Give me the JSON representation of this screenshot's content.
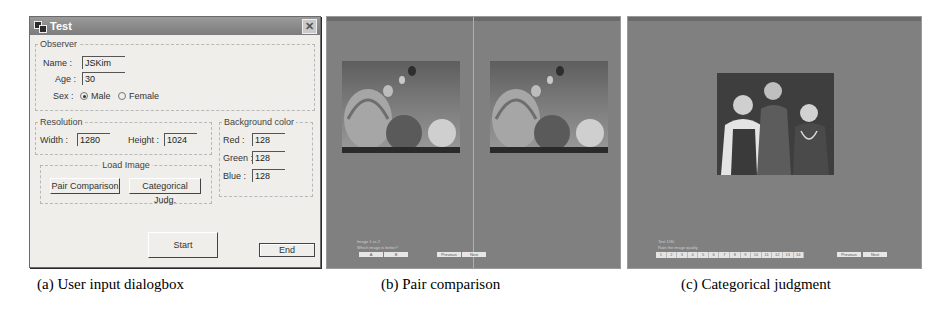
{
  "dialog": {
    "title": "Test",
    "observer": {
      "legend": "Observer",
      "name_label": "Name :",
      "name_value": "JSKim",
      "age_label": "Age :",
      "age_value": "30",
      "sex_label": "Sex :",
      "sex_options": [
        "Male",
        "Female"
      ],
      "sex_selected": "Male"
    },
    "resolution": {
      "legend": "Resolution",
      "width_label": "Width :",
      "width_value": "1280",
      "height_label": "Height :",
      "height_value": "1024"
    },
    "background_color": {
      "legend": "Background color",
      "red_label": "Red :",
      "red_value": "128",
      "green_label": "Green :",
      "green_value": "128",
      "blue_label": "Blue :",
      "blue_value": "128"
    },
    "load_image": {
      "legend": "Load Image",
      "pair_button": "Pair Comparison",
      "categorical_button": "Categorical Judg."
    },
    "start_button": "Start",
    "end_button": "End"
  },
  "pair_screen": {
    "image_subject": "hot air balloons",
    "prompt_line1": "Image 1 vs 2",
    "prompt_line2": "Which image is better?",
    "choice_buttons": [
      "A",
      "B"
    ],
    "nav_buttons": [
      "Previous",
      "Next"
    ]
  },
  "categorical_screen": {
    "image_subject": "three people in costumes",
    "prompt_line1": "Test 1/30",
    "prompt_line2": "Rate the image quality",
    "scale": [
      "1",
      "2",
      "3",
      "4",
      "5",
      "6",
      "7",
      "8",
      "9",
      "10",
      "11",
      "12",
      "13",
      "14"
    ],
    "nav_buttons": [
      "Previous",
      "Next"
    ]
  },
  "captions": {
    "a": "(a) User input dialogbox",
    "b": "(b) Pair comparison",
    "c": "(c) Categorical judgment"
  }
}
